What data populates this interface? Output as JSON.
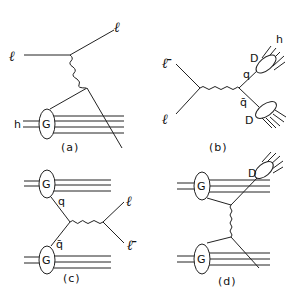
{
  "figure": {
    "panels": [
      {
        "id": "a",
        "caption": "(a)",
        "labels": {
          "lepton_in": "ℓ",
          "lepton_out": "ℓ",
          "hadron": "h",
          "blob": "G"
        }
      },
      {
        "id": "b",
        "caption": "(b)",
        "labels": {
          "antilepton": "ℓ̄",
          "lepton": "ℓ",
          "quark": "q",
          "antiquark": "q̄",
          "frag_top": "D",
          "frag_bottom": "D",
          "hadron": "h"
        }
      },
      {
        "id": "c",
        "caption": "(c)",
        "labels": {
          "blob_top": "G",
          "blob_bottom": "G",
          "quark": "q",
          "antiquark": "q̄",
          "lepton": "ℓ",
          "antilepton": "ℓ̄"
        }
      },
      {
        "id": "d",
        "caption": "(d)",
        "labels": {
          "blob_top": "G",
          "blob_bottom": "G",
          "frag": "D"
        }
      }
    ]
  }
}
